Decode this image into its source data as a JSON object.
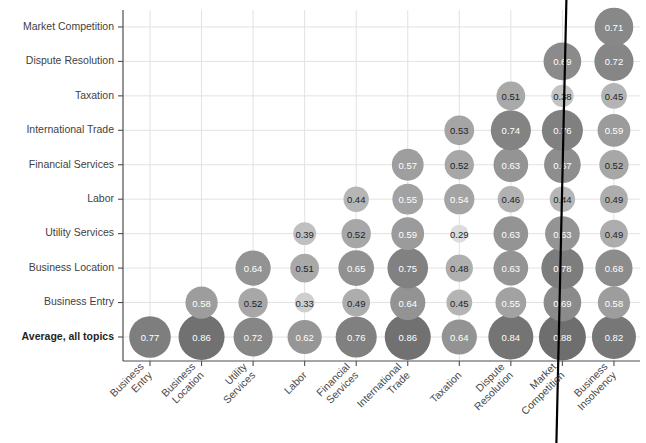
{
  "chart_data": {
    "type": "heatmap",
    "title": "",
    "subtitle": "",
    "xlabel": "",
    "ylabel": "",
    "legend": [],
    "grid": true,
    "x_categories": [
      "Business Entry",
      "Business Location",
      "Utility Services",
      "Labor",
      "Financial Services",
      "International Trade",
      "Taxation",
      "Dispute Resolution",
      "Market Competition",
      "Business Insolvency"
    ],
    "y_categories": [
      "Average, all topics",
      "Business Entry",
      "Business Location",
      "Utility Services",
      "Labor",
      "Financial Services",
      "International Trade",
      "Taxation",
      "Dispute Resolution",
      "Market Competition"
    ],
    "value_min": 0.29,
    "value_max": 0.88,
    "points": [
      {
        "x": "Business Entry",
        "y": "Average, all topics",
        "v": 0.77,
        "label": "0.77"
      },
      {
        "x": "Business Location",
        "y": "Average, all topics",
        "v": 0.86,
        "label": "0.86"
      },
      {
        "x": "Utility Services",
        "y": "Average, all topics",
        "v": 0.72,
        "label": "0.72"
      },
      {
        "x": "Labor",
        "y": "Average, all topics",
        "v": 0.62,
        "label": "0.62"
      },
      {
        "x": "Financial Services",
        "y": "Average, all topics",
        "v": 0.76,
        "label": "0.76"
      },
      {
        "x": "International Trade",
        "y": "Average, all topics",
        "v": 0.86,
        "label": "0.86"
      },
      {
        "x": "Taxation",
        "y": "Average, all topics",
        "v": 0.64,
        "label": "0.64"
      },
      {
        "x": "Dispute Resolution",
        "y": "Average, all topics",
        "v": 0.84,
        "label": "0.84"
      },
      {
        "x": "Market Competition",
        "y": "Average, all topics",
        "v": 0.88,
        "label": "0.88"
      },
      {
        "x": "Business Insolvency",
        "y": "Average, all topics",
        "v": 0.82,
        "label": "0.82"
      },
      {
        "x": "Business Location",
        "y": "Business Entry",
        "v": 0.58,
        "label": "0.58"
      },
      {
        "x": "Utility Services",
        "y": "Business Entry",
        "v": 0.52,
        "label": "0.52"
      },
      {
        "x": "Labor",
        "y": "Business Entry",
        "v": 0.33,
        "label": "0.33"
      },
      {
        "x": "Financial Services",
        "y": "Business Entry",
        "v": 0.49,
        "label": "0.49"
      },
      {
        "x": "International Trade",
        "y": "Business Entry",
        "v": 0.64,
        "label": "0.64"
      },
      {
        "x": "Taxation",
        "y": "Business Entry",
        "v": 0.45,
        "label": "0.45"
      },
      {
        "x": "Dispute Resolution",
        "y": "Business Entry",
        "v": 0.55,
        "label": "0.55"
      },
      {
        "x": "Market Competition",
        "y": "Business Entry",
        "v": 0.69,
        "label": "0.69"
      },
      {
        "x": "Business Insolvency",
        "y": "Business Entry",
        "v": 0.58,
        "label": "0.58"
      },
      {
        "x": "Utility Services",
        "y": "Business Location",
        "v": 0.64,
        "label": "0.64"
      },
      {
        "x": "Labor",
        "y": "Business Location",
        "v": 0.51,
        "label": "0.51"
      },
      {
        "x": "Financial Services",
        "y": "Business Location",
        "v": 0.65,
        "label": "0.65"
      },
      {
        "x": "International Trade",
        "y": "Business Location",
        "v": 0.75,
        "label": "0.75"
      },
      {
        "x": "Taxation",
        "y": "Business Location",
        "v": 0.48,
        "label": "0.48"
      },
      {
        "x": "Dispute Resolution",
        "y": "Business Location",
        "v": 0.63,
        "label": "0.63"
      },
      {
        "x": "Market Competition",
        "y": "Business Location",
        "v": 0.78,
        "label": "0.78"
      },
      {
        "x": "Business Insolvency",
        "y": "Business Location",
        "v": 0.68,
        "label": "0.68"
      },
      {
        "x": "Labor",
        "y": "Utility Services",
        "v": 0.39,
        "label": "0.39"
      },
      {
        "x": "Financial Services",
        "y": "Utility Services",
        "v": 0.52,
        "label": "0.52"
      },
      {
        "x": "International Trade",
        "y": "Utility Services",
        "v": 0.59,
        "label": "0.59"
      },
      {
        "x": "Taxation",
        "y": "Utility Services",
        "v": 0.29,
        "label": "0.29"
      },
      {
        "x": "Dispute Resolution",
        "y": "Utility Services",
        "v": 0.63,
        "label": "0.63"
      },
      {
        "x": "Market Competition",
        "y": "Utility Services",
        "v": 0.63,
        "label": "0.63"
      },
      {
        "x": "Business Insolvency",
        "y": "Utility Services",
        "v": 0.49,
        "label": "0.49"
      },
      {
        "x": "Financial Services",
        "y": "Labor",
        "v": 0.44,
        "label": "0.44"
      },
      {
        "x": "International Trade",
        "y": "Labor",
        "v": 0.55,
        "label": "0.55"
      },
      {
        "x": "Taxation",
        "y": "Labor",
        "v": 0.54,
        "label": "0.54"
      },
      {
        "x": "Dispute Resolution",
        "y": "Labor",
        "v": 0.46,
        "label": "0.46"
      },
      {
        "x": "Market Competition",
        "y": "Labor",
        "v": 0.44,
        "label": "0.44"
      },
      {
        "x": "Business Insolvency",
        "y": "Labor",
        "v": 0.49,
        "label": "0.49"
      },
      {
        "x": "International Trade",
        "y": "Financial Services",
        "v": 0.57,
        "label": "0.57"
      },
      {
        "x": "Taxation",
        "y": "Financial Services",
        "v": 0.52,
        "label": "0.52"
      },
      {
        "x": "Dispute Resolution",
        "y": "Financial Services",
        "v": 0.63,
        "label": "0.63"
      },
      {
        "x": "Market Competition",
        "y": "Financial Services",
        "v": 0.67,
        "label": "0.67"
      },
      {
        "x": "Business Insolvency",
        "y": "Financial Services",
        "v": 0.52,
        "label": "0.52"
      },
      {
        "x": "Taxation",
        "y": "International Trade",
        "v": 0.53,
        "label": "0.53"
      },
      {
        "x": "Dispute Resolution",
        "y": "International Trade",
        "v": 0.74,
        "label": "0.74"
      },
      {
        "x": "Market Competition",
        "y": "International Trade",
        "v": 0.76,
        "label": "0.76"
      },
      {
        "x": "Business Insolvency",
        "y": "International Trade",
        "v": 0.59,
        "label": "0.59"
      },
      {
        "x": "Dispute Resolution",
        "y": "Taxation",
        "v": 0.51,
        "label": "0.51"
      },
      {
        "x": "Market Competition",
        "y": "Taxation",
        "v": 0.38,
        "label": "0.38"
      },
      {
        "x": "Business Insolvency",
        "y": "Taxation",
        "v": 0.45,
        "label": "0.45"
      },
      {
        "x": "Market Competition",
        "y": "Dispute Resolution",
        "v": 0.69,
        "label": "0.69"
      },
      {
        "x": "Business Insolvency",
        "y": "Dispute Resolution",
        "v": 0.72,
        "label": "0.72"
      },
      {
        "x": "Business Insolvency",
        "y": "Market Competition",
        "v": 0.71,
        "label": "0.71"
      }
    ],
    "annotations": [
      {
        "name": "vertical-marker-line",
        "near": "Market Competition",
        "color": "#000000"
      }
    ]
  },
  "style": {
    "bubble_high_color": "#6e6e6e",
    "bubble_low_color": "#dcdcdc",
    "bubble_mid_color": "#a8a8a8",
    "text_dark": "#1f1f1f",
    "text_light": "#ffffff",
    "grid_color": "#e2e2e2",
    "axis_color": "#4d4d4d",
    "marker_color": "#000000",
    "background": "#ffffff"
  }
}
